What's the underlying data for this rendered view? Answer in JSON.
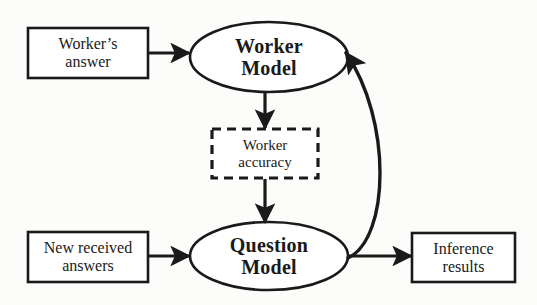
{
  "diagram": {
    "type": "flowchart",
    "colors": {
      "stroke": "#1a1a1a",
      "background": "#fcfcfa",
      "text": "#1a1a1a"
    },
    "nodes": [
      {
        "id": "worker-answer",
        "shape": "rectangle",
        "border": "solid",
        "line1": "Worker’s",
        "line2": "answer"
      },
      {
        "id": "worker-model",
        "shape": "ellipse",
        "border": "solid",
        "line1": "Worker",
        "line2": "Model"
      },
      {
        "id": "worker-accuracy",
        "shape": "rectangle",
        "border": "dashed",
        "line1": "Worker",
        "line2": "accuracy"
      },
      {
        "id": "new-answers",
        "shape": "rectangle",
        "border": "solid",
        "line1": "New received",
        "line2": "answers"
      },
      {
        "id": "question-model",
        "shape": "ellipse",
        "border": "solid",
        "line1": "Question",
        "line2": "Model"
      },
      {
        "id": "inference-results",
        "shape": "rectangle",
        "border": "solid",
        "line1": "Inference",
        "line2": "results"
      }
    ],
    "edges": [
      {
        "id": "worker-answer-to-worker-model",
        "from": "worker-answer",
        "to": "worker-model",
        "style": "straight-horizontal"
      },
      {
        "id": "worker-model-to-worker-accuracy",
        "from": "worker-model",
        "to": "worker-accuracy",
        "style": "straight-vertical"
      },
      {
        "id": "worker-accuracy-to-question-model",
        "from": "worker-accuracy",
        "to": "question-model",
        "style": "straight-vertical"
      },
      {
        "id": "new-answers-to-question-model",
        "from": "new-answers",
        "to": "question-model",
        "style": "straight-horizontal"
      },
      {
        "id": "question-model-to-inference-results",
        "from": "question-model",
        "to": "inference-results",
        "style": "straight-horizontal"
      },
      {
        "id": "question-model-to-worker-model",
        "from": "question-model",
        "to": "worker-model",
        "style": "curved-feedback"
      }
    ]
  }
}
